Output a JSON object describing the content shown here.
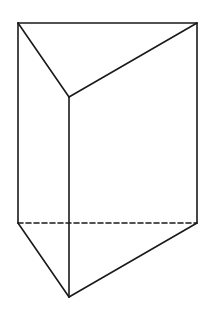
{
  "figure": {
    "stroke_color": "#1a1a1a",
    "background": "#ffffff",
    "vertices": {
      "top_left": [
        18,
        23
      ],
      "top_right": [
        197,
        23
      ],
      "top_front": [
        69,
        97
      ],
      "bottom_left": [
        18,
        223
      ],
      "bottom_right": [
        197,
        223
      ],
      "bottom_front": [
        69,
        297
      ]
    },
    "solid_edges": [
      [
        "top_left",
        "top_right"
      ],
      [
        "top_left",
        "top_front"
      ],
      [
        "top_front",
        "top_right"
      ],
      [
        "top_left",
        "bottom_left"
      ],
      [
        "top_right",
        "bottom_right"
      ],
      [
        "top_front",
        "bottom_front"
      ],
      [
        "bottom_left",
        "bottom_front"
      ],
      [
        "bottom_front",
        "bottom_right"
      ]
    ],
    "hidden_edges": [
      [
        "bottom_left",
        "bottom_right"
      ]
    ]
  }
}
